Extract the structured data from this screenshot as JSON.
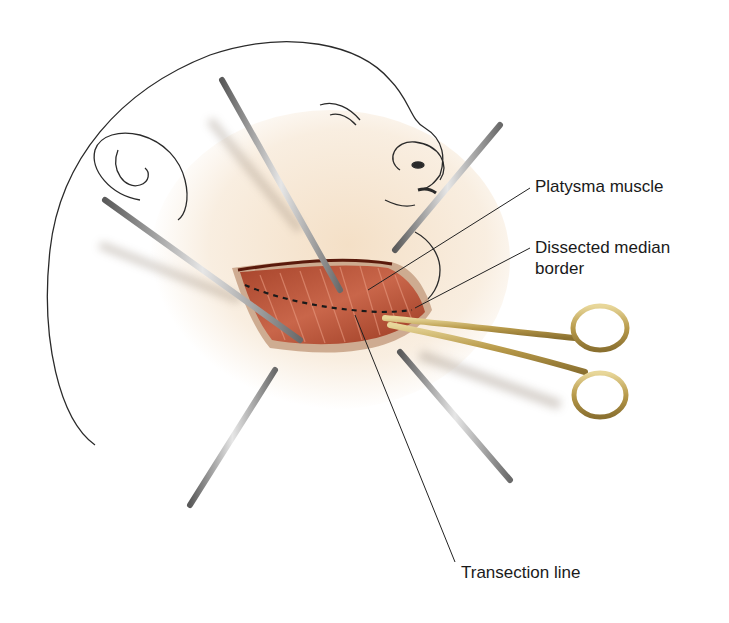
{
  "figure": {
    "labels": {
      "platysma": "Platysma muscle",
      "dissected_line1": "Dissected median",
      "dissected_line2": "border",
      "transection": "Transection line"
    },
    "colors": {
      "skin": "#f6e6d2",
      "muscle": "#b8553a",
      "muscle_dark": "#7a2a18",
      "retractor": "#9a9a9a",
      "scissors": "#c9b26a",
      "outline": "#2a2a2a",
      "leader_line": "#222222"
    }
  }
}
